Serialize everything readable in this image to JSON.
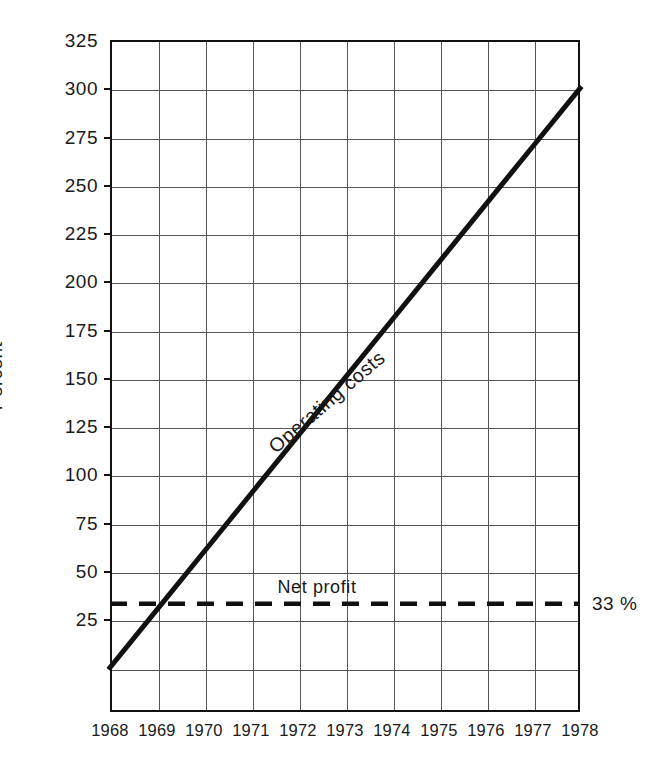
{
  "chart_data": {
    "type": "line",
    "title": "",
    "subtitle": "",
    "xlabel": "",
    "ylabel": "Percent",
    "x": [
      1968,
      1969,
      1970,
      1971,
      1972,
      1973,
      1974,
      1975,
      1976,
      1977,
      1978
    ],
    "xtick_labels": [
      "1968",
      "1969",
      "1970",
      "1971",
      "1972",
      "1973",
      "1974",
      "1975",
      "1976",
      "1977",
      "1978"
    ],
    "ytick_labels": [
      "325",
      "300",
      "275",
      "250",
      "225",
      "200",
      "175",
      "150",
      "125",
      "100",
      "75",
      "50",
      "25"
    ],
    "ytick_values": [
      325,
      300,
      275,
      250,
      225,
      200,
      175,
      150,
      125,
      100,
      75,
      50,
      25
    ],
    "xlim": [
      1968,
      1978
    ],
    "ylim": [
      -23,
      325
    ],
    "grid": true,
    "legend_position": "inline",
    "series": [
      {
        "name": "Operating costs",
        "label": "Operating costs",
        "style": "solid",
        "color": "#111111",
        "values": [
          0,
          30,
          60,
          90,
          120,
          150,
          180,
          210,
          240,
          270,
          300
        ]
      },
      {
        "name": "Net profit",
        "label": "Net profit",
        "style": "dashed",
        "color": "#111111",
        "constant": 33,
        "value_label": "33 %",
        "values": [
          33,
          33,
          33,
          33,
          33,
          33,
          33,
          33,
          33,
          33,
          33
        ]
      }
    ],
    "annotations": [
      {
        "text": "Operating costs",
        "kind": "series-label",
        "rotated": true
      },
      {
        "text": "Net profit",
        "kind": "series-label",
        "rotated": false
      },
      {
        "text": "33 %",
        "kind": "value-label",
        "rotated": false
      }
    ]
  },
  "axes": {
    "y_title": "Percent"
  }
}
